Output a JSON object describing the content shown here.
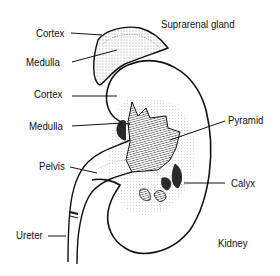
{
  "figure": {
    "colors": {
      "ink": "#111111",
      "background": "#ffffff",
      "dark_fill": "#2a2a2a"
    }
  },
  "labels": {
    "cortex_gland": "Cortex",
    "medulla_gland": "Medulla",
    "suprarenal_gland": "Suprarenal gland",
    "cortex_kidney": "Cortex",
    "medulla_kidney": "Medulla",
    "pyramid": "Pyramid",
    "pelvis": "Pelvis",
    "calyx": "Calyx",
    "ureter": "Ureter",
    "kidney": "Kidney"
  }
}
